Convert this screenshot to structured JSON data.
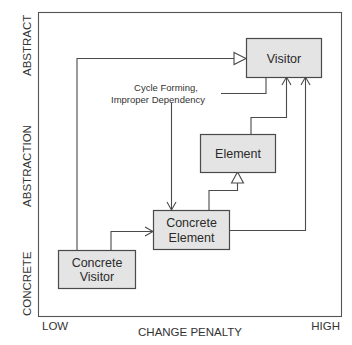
{
  "diagram": {
    "y_axis": {
      "title": "ABSTRACTION",
      "top_label": "ABSTRACT",
      "bottom_label": "CONCRETE"
    },
    "x_axis": {
      "title": "CHANGE PENALTY",
      "left_label": "LOW",
      "right_label": "HIGH"
    },
    "nodes": {
      "visitor": {
        "line1": "Visitor"
      },
      "element": {
        "line1": "Element"
      },
      "concrete_element": {
        "line1": "Concrete",
        "line2": "Element"
      },
      "concrete_visitor": {
        "line1": "Concrete",
        "line2": "Visitor"
      }
    },
    "annotation": {
      "line1": "Cycle Forming,",
      "line2": "Improper Dependency"
    },
    "edges": [
      {
        "from": "Concrete Visitor",
        "to": "Visitor",
        "type": "inheritance"
      },
      {
        "from": "Concrete Visitor",
        "to": "Concrete Element",
        "type": "dependency"
      },
      {
        "from": "Concrete Element",
        "to": "Element",
        "type": "inheritance"
      },
      {
        "from": "Concrete Element",
        "to": "Visitor",
        "type": "dependency"
      },
      {
        "from": "Element",
        "to": "Visitor",
        "type": "dependency"
      },
      {
        "from": "Visitor",
        "to": "Concrete Element",
        "type": "dependency",
        "note": "Cycle Forming, Improper Dependency"
      }
    ],
    "colors": {
      "box_fill": "#e4e4e4",
      "stroke": "#4a4a4a",
      "text": "#333333"
    }
  }
}
